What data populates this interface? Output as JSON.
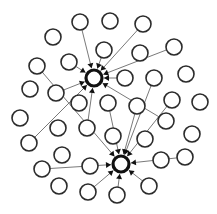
{
  "diagram": {
    "type": "network-graph",
    "width": 217,
    "height": 214,
    "node_radius": 8,
    "hub_radius": 8,
    "colors": {
      "background": "#ffffff",
      "node_stroke": "#2b2b2b",
      "edge": "#6a6a6a",
      "hub": "#111111"
    },
    "hubs": [
      {
        "id": "hub1",
        "x": 94,
        "y": 78
      },
      {
        "id": "hub2",
        "x": 121,
        "y": 164
      }
    ],
    "nodes": [
      {
        "id": "n1",
        "x": 80,
        "y": 22
      },
      {
        "id": "n2",
        "x": 110,
        "y": 21
      },
      {
        "id": "n3",
        "x": 143,
        "y": 24
      },
      {
        "id": "n4",
        "x": 53,
        "y": 37
      },
      {
        "id": "n5",
        "x": 104,
        "y": 50
      },
      {
        "id": "n6",
        "x": 140,
        "y": 53
      },
      {
        "id": "n7",
        "x": 174,
        "y": 47
      },
      {
        "id": "n8",
        "x": 37,
        "y": 66
      },
      {
        "id": "n9",
        "x": 69,
        "y": 62
      },
      {
        "id": "n10",
        "x": 125,
        "y": 78
      },
      {
        "id": "n11",
        "x": 154,
        "y": 78
      },
      {
        "id": "n12",
        "x": 186,
        "y": 74
      },
      {
        "id": "n13",
        "x": 30,
        "y": 89
      },
      {
        "id": "n14",
        "x": 56,
        "y": 93
      },
      {
        "id": "n15",
        "x": 79,
        "y": 103
      },
      {
        "id": "n16",
        "x": 108,
        "y": 103
      },
      {
        "id": "n17",
        "x": 137,
        "y": 106
      },
      {
        "id": "n18",
        "x": 172,
        "y": 100
      },
      {
        "id": "n19",
        "x": 200,
        "y": 102
      },
      {
        "id": "n20",
        "x": 20,
        "y": 118
      },
      {
        "id": "n21",
        "x": 58,
        "y": 128
      },
      {
        "id": "n22",
        "x": 87,
        "y": 128
      },
      {
        "id": "n23",
        "x": 166,
        "y": 121
      },
      {
        "id": "n24",
        "x": 192,
        "y": 134
      },
      {
        "id": "n25",
        "x": 29,
        "y": 143
      },
      {
        "id": "n26",
        "x": 113,
        "y": 136
      },
      {
        "id": "n27",
        "x": 145,
        "y": 139
      },
      {
        "id": "n28",
        "x": 62,
        "y": 155
      },
      {
        "id": "n29",
        "x": 161,
        "y": 160
      },
      {
        "id": "n30",
        "x": 185,
        "y": 157
      },
      {
        "id": "n31",
        "x": 42,
        "y": 169
      },
      {
        "id": "n32",
        "x": 90,
        "y": 166
      },
      {
        "id": "n33",
        "x": 59,
        "y": 186
      },
      {
        "id": "n34",
        "x": 88,
        "y": 192
      },
      {
        "id": "n35",
        "x": 117,
        "y": 195
      },
      {
        "id": "n36",
        "x": 149,
        "y": 186
      }
    ],
    "edges": [
      {
        "from": "n1",
        "to": "hub1"
      },
      {
        "from": "n5",
        "to": "hub1"
      },
      {
        "from": "n3",
        "to": "hub1"
      },
      {
        "from": "n7",
        "to": "hub1"
      },
      {
        "from": "n10",
        "to": "hub1"
      },
      {
        "from": "n9",
        "to": "hub1"
      },
      {
        "from": "n14",
        "to": "hub1"
      },
      {
        "from": "n25",
        "to": "hub1"
      },
      {
        "from": "n22",
        "to": "hub1"
      },
      {
        "from": "n23",
        "to": "hub1"
      },
      {
        "from": "n8",
        "to": "hub2"
      },
      {
        "from": "n16",
        "to": "hub2"
      },
      {
        "from": "n17",
        "to": "hub2"
      },
      {
        "from": "n11",
        "to": "hub2"
      },
      {
        "from": "n18",
        "to": "hub2"
      },
      {
        "from": "n31",
        "to": "hub2"
      },
      {
        "from": "n30",
        "to": "hub2"
      },
      {
        "from": "n34",
        "to": "hub2"
      },
      {
        "from": "n35",
        "to": "hub2"
      },
      {
        "from": "n36",
        "to": "hub2"
      }
    ]
  }
}
